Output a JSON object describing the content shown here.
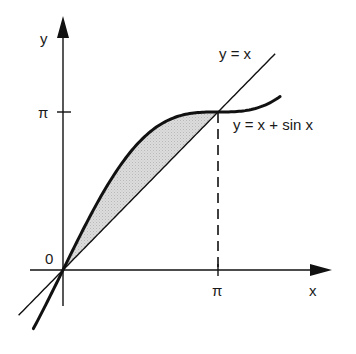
{
  "diagram": {
    "title": "",
    "axes": {
      "x_label": "x",
      "y_label": "y",
      "origin_label": "0",
      "x_tick_label": "π",
      "y_tick_label": "π"
    },
    "curves": [
      {
        "name": "line",
        "label": "y = x",
        "expression": "x",
        "domain": [
          -0.9,
          4.3
        ],
        "stroke_width": 1.4
      },
      {
        "name": "curve",
        "label": "y = x + sin x",
        "expression": "x + sin x",
        "domain": [
          -0.6,
          4.4
        ],
        "stroke_width": 3
      }
    ],
    "shaded_region": {
      "between": [
        "y = x + sin x",
        "y = x"
      ],
      "from": "0",
      "to": "π",
      "fill": "#d4d4d4"
    },
    "dashed_guide": {
      "from": "(π, 0)",
      "to": "(π, π)"
    },
    "colors": {
      "ink": "#111111",
      "shade": "#d4d4d4",
      "background": "#ffffff"
    }
  }
}
